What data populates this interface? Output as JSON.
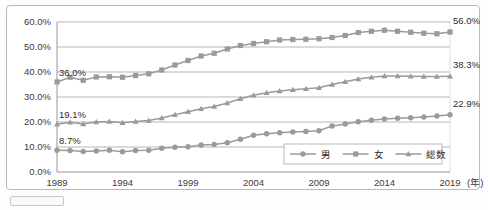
{
  "chart_data": {
    "type": "line",
    "title": "",
    "xlabel": "年",
    "ylabel": "",
    "grid": true,
    "legend_position": "bottom-right",
    "ylim": [
      0,
      60
    ],
    "ytick_labels": [
      "0.0%",
      "10.0%",
      "20.0%",
      "30.0%",
      "40.0%",
      "50.0%",
      "60.0%"
    ],
    "ytick_values": [
      0,
      10,
      20,
      30,
      40,
      50,
      60
    ],
    "xtick_labels": [
      "1989",
      "1994",
      "1999",
      "2004",
      "2009",
      "2014",
      "2019"
    ],
    "xtick_values": [
      1989,
      1994,
      1999,
      2004,
      2009,
      2014,
      2019
    ],
    "x_axis_unit_label": "(年)",
    "x": [
      1989,
      1990,
      1991,
      1992,
      1993,
      1994,
      1995,
      1996,
      1997,
      1998,
      1999,
      2000,
      2001,
      2002,
      2003,
      2004,
      2005,
      2006,
      2007,
      2008,
      2009,
      2010,
      2011,
      2012,
      2013,
      2014,
      2015,
      2016,
      2017,
      2018,
      2019
    ],
    "series": [
      {
        "name": "男",
        "marker": "circle",
        "color": "#9a9a9a",
        "values": [
          8.7,
          8.6,
          8.2,
          8.4,
          8.7,
          8.1,
          8.6,
          8.7,
          9.5,
          9.9,
          10.1,
          10.8,
          11.0,
          11.7,
          13.1,
          14.7,
          15.3,
          15.7,
          16.0,
          16.2,
          16.5,
          18.4,
          19.2,
          20.1,
          20.7,
          21.2,
          21.5,
          21.7,
          22.0,
          22.4,
          22.9
        ],
        "start_label": "8.7%",
        "end_label": "22.9%"
      },
      {
        "name": "女",
        "marker": "square",
        "color": "#9a9a9a",
        "values": [
          36.0,
          37.9,
          36.7,
          38.0,
          38.1,
          37.9,
          38.6,
          39.3,
          40.8,
          42.8,
          44.6,
          46.4,
          47.5,
          49.2,
          50.6,
          51.4,
          52.1,
          52.8,
          53.0,
          53.1,
          53.3,
          53.8,
          54.6,
          55.8,
          56.3,
          56.7,
          56.3,
          55.9,
          55.5,
          55.3,
          56.0
        ],
        "start_label": "36.0%",
        "end_label": "56.0%"
      },
      {
        "name": "総数",
        "marker": "triangle",
        "color": "#9a9a9a",
        "values": [
          19.1,
          19.9,
          19.2,
          20.0,
          20.2,
          19.7,
          20.2,
          20.6,
          21.6,
          22.9,
          24.1,
          25.3,
          26.2,
          27.6,
          29.3,
          30.7,
          31.7,
          32.4,
          32.9,
          33.3,
          33.7,
          35.0,
          36.1,
          37.2,
          37.9,
          38.4,
          38.4,
          38.3,
          38.2,
          38.2,
          38.3
        ],
        "start_label": "19.1%",
        "end_label": "38.3%"
      }
    ],
    "annotations": [
      {
        "text": "36.0%",
        "series": "女",
        "position": "start"
      },
      {
        "text": "19.1%",
        "series": "総数",
        "position": "start"
      },
      {
        "text": "8.7%",
        "series": "男",
        "position": "start"
      },
      {
        "text": "56.0%",
        "series": "女",
        "position": "end"
      },
      {
        "text": "38.3%",
        "series": "総数",
        "position": "end"
      },
      {
        "text": "22.9%",
        "series": "男",
        "position": "end"
      }
    ]
  },
  "legend": {
    "items": [
      {
        "label": "男",
        "marker": "circle"
      },
      {
        "label": "女",
        "marker": "square"
      },
      {
        "label": "総数",
        "marker": "triangle"
      }
    ]
  }
}
